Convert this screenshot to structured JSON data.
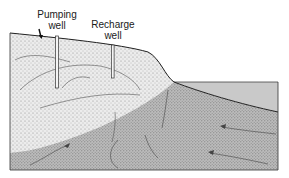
{
  "diagram": {
    "type": "coastal-aquifer-cross-section",
    "labels": {
      "pumping_well": {
        "line1": "Pumping",
        "line2": "well"
      },
      "recharge_well": {
        "line1": "Recharge",
        "line2": "well"
      }
    },
    "zones": [
      {
        "name": "freshwater-aquifer",
        "fill": "light-stipple"
      },
      {
        "name": "saltwater-wedge",
        "fill": "dark-stipple"
      },
      {
        "name": "sea",
        "fill": "flat-gray"
      }
    ],
    "colors": {
      "background": "#ffffff",
      "freshwater": "#e4e4e4",
      "saltwater": "#b9b9b9",
      "sea": "#c9c9c9",
      "outline": "#333333"
    }
  }
}
